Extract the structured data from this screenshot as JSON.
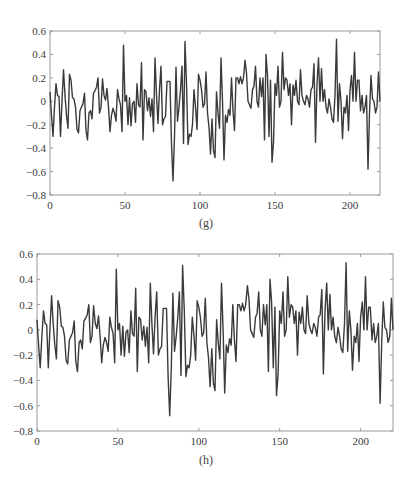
{
  "figure": {
    "panels": [
      {
        "id": "g",
        "caption": "(g)"
      },
      {
        "id": "h",
        "caption": "(h)"
      }
    ]
  },
  "style": {
    "line_color": "#3a3a3a",
    "axis_color": "#9a9a9a",
    "tick_label_color": "#3a3a3a"
  },
  "chart_data": [
    {
      "type": "line",
      "title": "",
      "caption": "(g)",
      "xlabel": "",
      "ylabel": "",
      "xlim": [
        0,
        220
      ],
      "ylim": [
        -0.8,
        0.6
      ],
      "xticks": [
        0,
        50,
        100,
        150,
        200
      ],
      "xtick_labels": [
        "0",
        "50",
        "100",
        "150",
        "200"
      ],
      "yticks": [
        0.6,
        0.4,
        0.2,
        0,
        -0.2,
        -0.4,
        -0.6,
        -0.8
      ],
      "ytick_labels": [
        "0.6",
        "0.4",
        "0.2",
        "0",
        "−0.2",
        "−0.4",
        "−0.6",
        "−0.8"
      ],
      "grid": false,
      "legend": null,
      "series": [
        {
          "name": "signal",
          "x": [
            0,
            1,
            2,
            3,
            4,
            5,
            6,
            7,
            8,
            9,
            10,
            11,
            12,
            13,
            14,
            15,
            16,
            17,
            18,
            19,
            20,
            21,
            22,
            23,
            24,
            25,
            26,
            27,
            28,
            29,
            30,
            31,
            32,
            33,
            34,
            35,
            36,
            37,
            38,
            39,
            40,
            41,
            42,
            43,
            44,
            45,
            46,
            47,
            48,
            49,
            50,
            51,
            52,
            53,
            54,
            55,
            56,
            57,
            58,
            59,
            60,
            61,
            62,
            63,
            64,
            65,
            66,
            67,
            68,
            69,
            70,
            71,
            72,
            73,
            74,
            75,
            76,
            77,
            78,
            79,
            80,
            81,
            82,
            83,
            84,
            85,
            86,
            87,
            88,
            89,
            90,
            91,
            92,
            93,
            94,
            95,
            96,
            97,
            98,
            99,
            100,
            101,
            102,
            103,
            104,
            105,
            106,
            107,
            108,
            109,
            110,
            111,
            112,
            113,
            114,
            115,
            116,
            117,
            118,
            119,
            120,
            121,
            122,
            123,
            124,
            125,
            126,
            127,
            128,
            129,
            130,
            131,
            132,
            133,
            134,
            135,
            136,
            137,
            138,
            139,
            140,
            141,
            142,
            143,
            144,
            145,
            146,
            147,
            148,
            149,
            150,
            151,
            152,
            153,
            154,
            155,
            156,
            157,
            158,
            159,
            160,
            161,
            162,
            163,
            164,
            165,
            166,
            167,
            168,
            169,
            170,
            171,
            172,
            173,
            174,
            175,
            176,
            177,
            178,
            179,
            180,
            181,
            182,
            183,
            184,
            185,
            186,
            187,
            188,
            189,
            190,
            191,
            192,
            193,
            194,
            195,
            196,
            197,
            198,
            199,
            200,
            201,
            202,
            203,
            204,
            205,
            206,
            207,
            208,
            209,
            210,
            211,
            212,
            213,
            214,
            215,
            216,
            217,
            218,
            219,
            220
          ],
          "y": [
            0.08,
            -0.12,
            -0.3,
            -0.05,
            0.15,
            0.05,
            0.04,
            -0.3,
            0.0,
            0.27,
            0.05,
            -0.12,
            -0.23,
            0.23,
            0.18,
            0.03,
            0.02,
            -0.05,
            -0.24,
            -0.27,
            -0.08,
            -0.05,
            -0.02,
            0.07,
            -0.25,
            -0.33,
            -0.1,
            -0.08,
            -0.15,
            0.07,
            0.09,
            0.12,
            0.2,
            -0.1,
            -0.05,
            0.19,
            0.05,
            0.01,
            0.11,
            -0.05,
            -0.26,
            -0.12,
            -0.06,
            -0.1,
            -0.17,
            0.1,
            0.02,
            -0.03,
            -0.26,
            0.48,
            0.0,
            0.05,
            -0.2,
            0.03,
            -0.21,
            -0.02,
            0.0,
            -0.18,
            0.15,
            -0.03,
            -0.05,
            0.33,
            -0.33,
            0.1,
            0.08,
            -0.08,
            0.03,
            -0.13,
            0.02,
            -0.26,
            0.37,
            0.05,
            -0.19,
            0.1,
            0.3,
            -0.2,
            -0.15,
            -0.13,
            0.17,
            0.17,
            0.17,
            -0.37,
            -0.68,
            -0.3,
            0.29,
            -0.17,
            -0.05,
            0.1,
            0.3,
            -0.36,
            0.51,
            0.15,
            -0.37,
            -0.28,
            -0.3,
            -0.2,
            0.1,
            -0.05,
            -0.24,
            0.23,
            0.18,
            0.1,
            -0.05,
            -0.02,
            0.25,
            -0.1,
            -0.22,
            -0.45,
            -0.15,
            -0.42,
            -0.48,
            0.08,
            -0.1,
            -0.23,
            0.37,
            0.0,
            -0.5,
            -0.12,
            -0.18,
            -0.07,
            -0.12,
            0.2,
            -0.08,
            -0.25,
            0.2,
            0.2,
            0.15,
            0.21,
            0.15,
            0.2,
            0.35,
            0.24,
            0.0,
            -0.03,
            -0.06,
            0.1,
            0.13,
            0.3,
            0.0,
            -0.05,
            0.2,
            0.04,
            0.2,
            -0.33,
            0.4,
            0.22,
            -0.3,
            0.18,
            -0.52,
            -0.35,
            0.15,
            0.05,
            0.3,
            -0.05,
            0.0,
            0.42,
            0.1,
            0.2,
            0.18,
            0.05,
            0.15,
            -0.2,
            0.14,
            0.05,
            0.18,
            0.0,
            -0.03,
            0.27,
            0.05,
            0.0,
            -0.03,
            0.05,
            0.02,
            -0.05,
            0.1,
            0.12,
            0.32,
            -0.35,
            0.15,
            0.37,
            0.0,
            0.28,
            0.0,
            0.1,
            -0.05,
            -0.1,
            0.02,
            -0.05,
            -0.15,
            -0.18,
            0.05,
            0.53,
            -0.17,
            0.15,
            0.0,
            -0.32,
            -0.05,
            -0.1,
            0.05,
            -0.25,
            0.1,
            0.22,
            0.0,
            0.42,
            0.0,
            0.18,
            0.18,
            -0.08,
            0.05,
            -0.1,
            -0.05,
            0.05,
            -0.58,
            -0.1,
            0.22,
            0.02,
            0.0,
            -0.1,
            -0.05,
            0.25,
            0.0,
            0.04,
            0.02
          ]
        }
      ]
    },
    {
      "type": "line",
      "title": "",
      "caption": "(h)",
      "xlabel": "",
      "ylabel": "",
      "xlim": [
        0,
        220
      ],
      "ylim": [
        -0.8,
        0.6
      ],
      "xticks": [
        0,
        50,
        100,
        150,
        200
      ],
      "xtick_labels": [
        "0",
        "50",
        "100",
        "150",
        "200"
      ],
      "yticks": [
        0.6,
        0.4,
        0.2,
        0,
        -0.2,
        -0.4,
        -0.6,
        -0.8
      ],
      "ytick_labels": [
        "0.6",
        "0.4",
        "0.2",
        "0",
        "−0.2",
        "−0.4",
        "−0.6",
        "−0.8"
      ],
      "grid": false,
      "legend": null,
      "series": [
        {
          "name": "signal",
          "same_as_panel": "g"
        }
      ]
    }
  ]
}
